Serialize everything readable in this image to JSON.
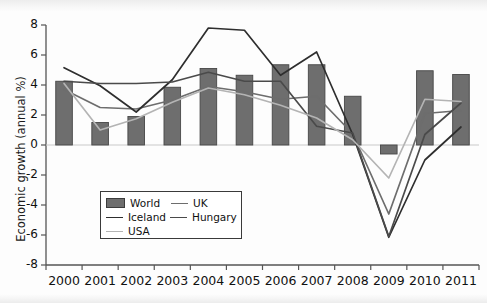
{
  "chart_data": {
    "type": "bar",
    "title": "",
    "subtitle": "",
    "xlabel": "",
    "ylabel": "Economic growth (annual %)",
    "categories": [
      "2000",
      "2001",
      "2002",
      "2003",
      "2004",
      "2005",
      "2006",
      "2007",
      "2008",
      "2009",
      "2010",
      "2011"
    ],
    "ylim": [
      -8,
      8
    ],
    "yticks": [
      -8,
      -6,
      -4,
      -2,
      0,
      2,
      4,
      6,
      8
    ],
    "ytick_labels": [
      "-8",
      "-6",
      "-4",
      "-2",
      "0",
      "2",
      "4",
      "6",
      "8"
    ],
    "grid": false,
    "legend_position": "inside-lower-left",
    "series": [
      {
        "name": "World",
        "kind": "bar",
        "color": "#6e6e6e",
        "values": [
          4.25,
          1.5,
          1.9,
          3.85,
          5.1,
          4.65,
          5.35,
          5.35,
          3.25,
          -0.6,
          4.95,
          4.7
        ]
      },
      {
        "name": "UK",
        "kind": "line",
        "color": "#6d6d6d",
        "values": [
          3.7,
          2.5,
          2.4,
          3.0,
          3.9,
          3.55,
          3.05,
          3.25,
          0.75,
          -4.6,
          2.1,
          2.3
        ]
      },
      {
        "name": "Iceland",
        "kind": "line",
        "color": "#2e2e2e",
        "values": [
          5.15,
          3.95,
          2.2,
          4.35,
          7.8,
          7.65,
          4.65,
          6.2,
          0.7,
          -6.15,
          -1.0,
          1.2
        ]
      },
      {
        "name": "Hungary",
        "kind": "line",
        "color": "#4a4a4a",
        "values": [
          4.25,
          4.1,
          4.1,
          4.2,
          4.85,
          4.25,
          4.25,
          1.25,
          0.8,
          -6.1,
          0.7,
          2.8
        ]
      },
      {
        "name": "USA",
        "kind": "line",
        "color": "#b4b4b4",
        "values": [
          4.1,
          1.0,
          1.75,
          2.85,
          3.8,
          3.35,
          2.65,
          1.8,
          0.35,
          -2.2,
          3.05,
          2.9
        ]
      }
    ]
  },
  "legend": {
    "entries": [
      {
        "label": "World",
        "marker": "bar-swatch"
      },
      {
        "label": "UK",
        "marker": "line-swatch"
      },
      {
        "label": "Iceland",
        "marker": "line-swatch"
      },
      {
        "label": "Hungary",
        "marker": "line-swatch"
      },
      {
        "label": "USA",
        "marker": "line-swatch"
      }
    ]
  }
}
